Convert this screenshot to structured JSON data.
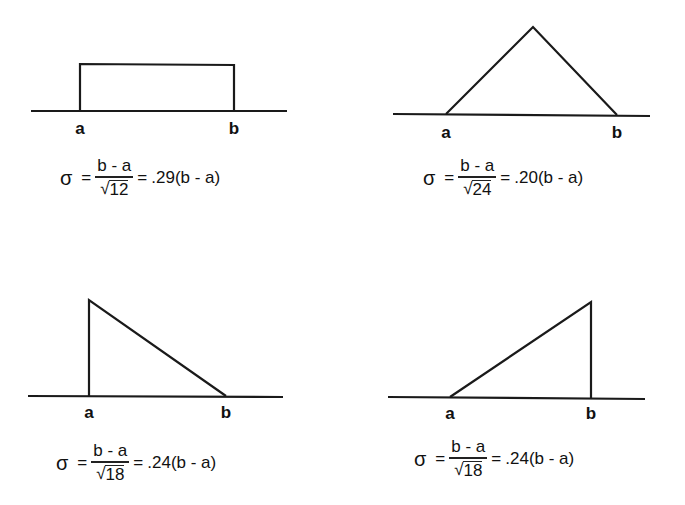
{
  "panels": [
    {
      "name": "uniform",
      "shape": "rectangle",
      "labels": {
        "a": "a",
        "b": "b"
      },
      "formula": {
        "sigma": "σ",
        "equals": "=",
        "numerator": "b - a",
        "radical": "√",
        "radicand": "12",
        "equals2": "=",
        "result": ".29(b - a)"
      }
    },
    {
      "name": "symmetric-triangle",
      "shape": "isosceles-triangle",
      "labels": {
        "a": "a",
        "b": "b"
      },
      "formula": {
        "sigma": "σ",
        "equals": "=",
        "numerator": "b - a",
        "radical": "√",
        "radicand": "24",
        "equals2": "=",
        "result": ".20(b - a)"
      }
    },
    {
      "name": "right-triangle-left",
      "shape": "right-triangle-peak-at-a",
      "labels": {
        "a": "a",
        "b": "b"
      },
      "formula": {
        "sigma": "σ",
        "equals": "=",
        "numerator": "b - a",
        "radical": "√",
        "radicand": "18",
        "equals2": "=",
        "result": ".24(b - a)"
      }
    },
    {
      "name": "right-triangle-right",
      "shape": "right-triangle-peak-at-b",
      "labels": {
        "a": "a",
        "b": "b"
      },
      "formula": {
        "sigma": "σ",
        "equals": "=",
        "numerator": "b - a",
        "radical": "√",
        "radicand": "18",
        "equals2": "=",
        "result": ".24(b - a)"
      }
    }
  ],
  "colors": {
    "line": "#1a1a1a",
    "background": "#ffffff"
  }
}
